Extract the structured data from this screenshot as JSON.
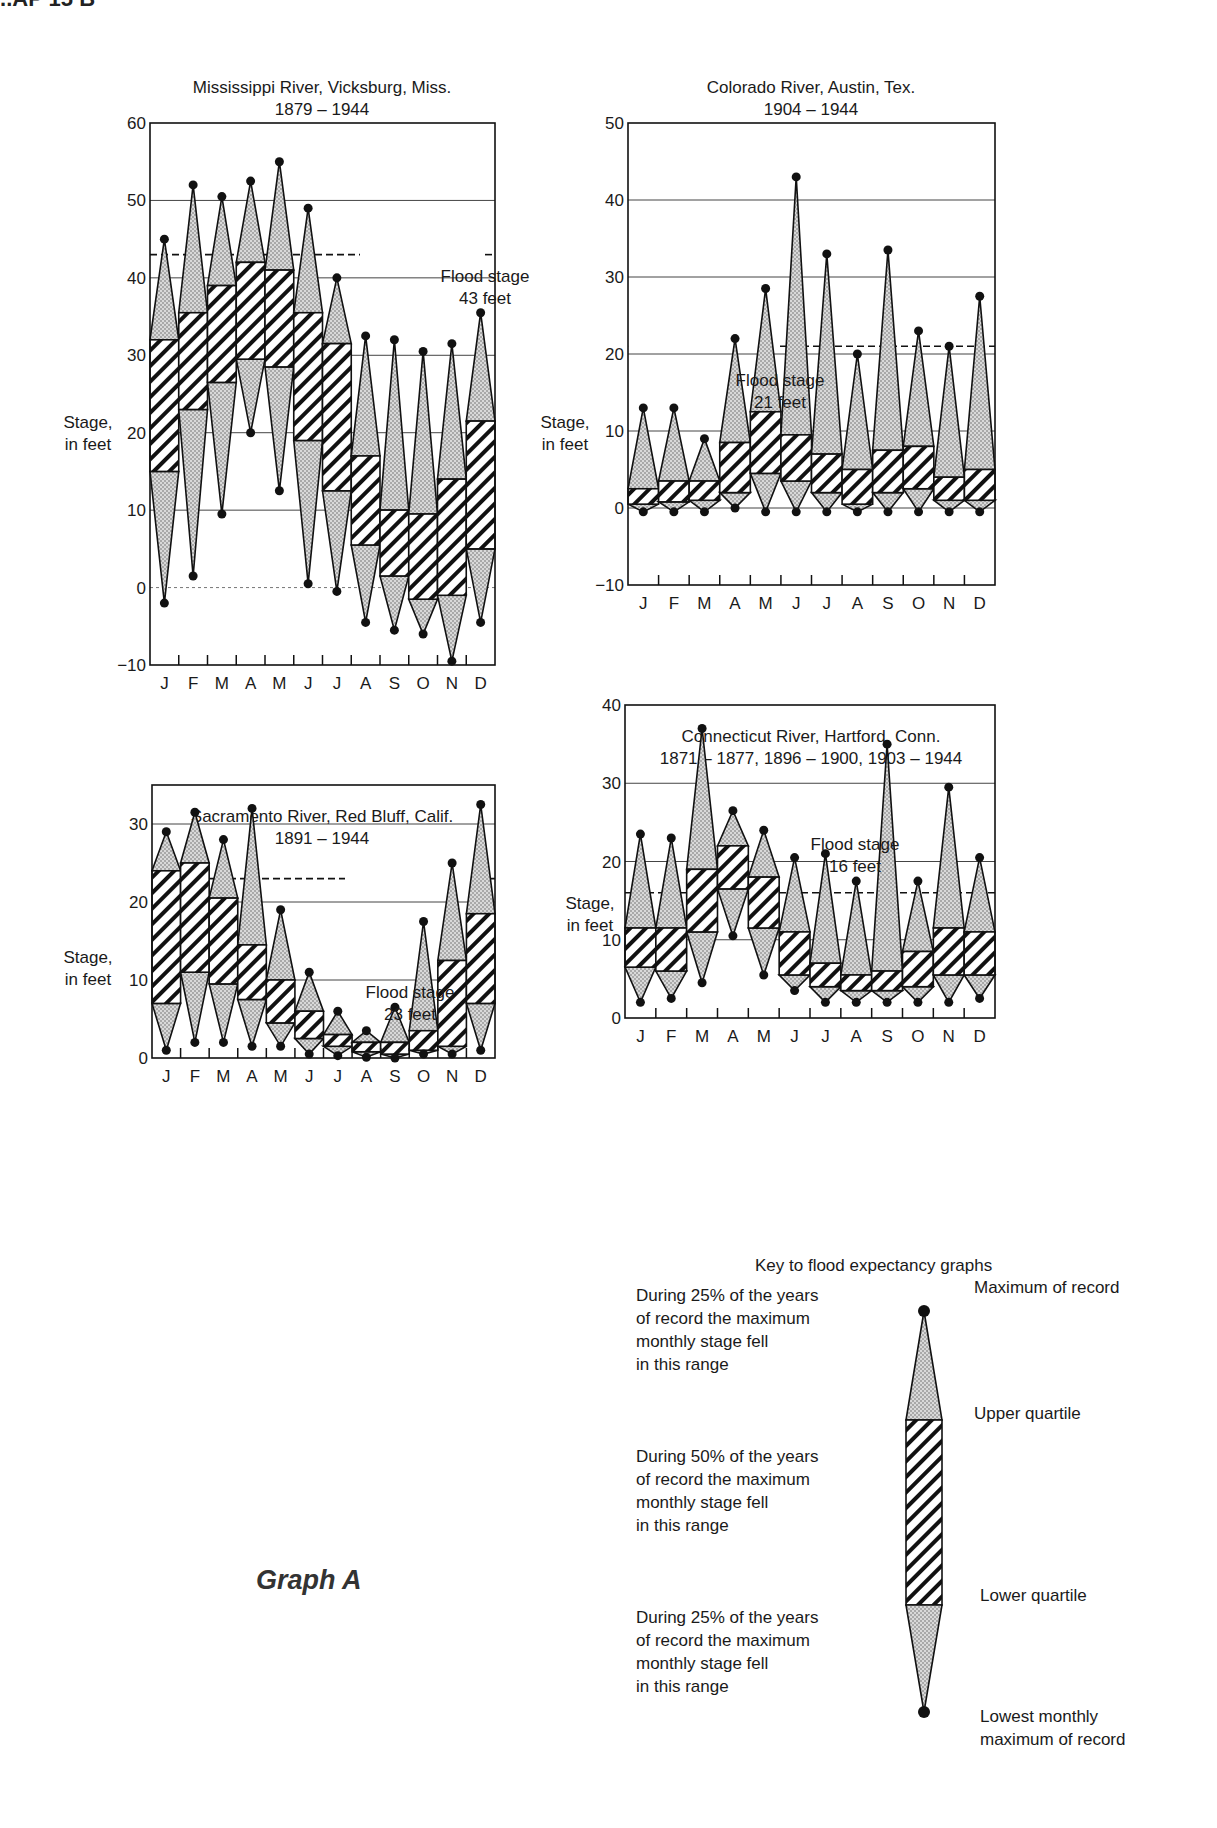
{
  "page": {
    "header_fragment": "...AP 15 B",
    "graph_label": "Graph A"
  },
  "key": {
    "title": "Key to flood expectancy graphs",
    "left_texts": [
      "During 25% of the years\nof record the maximum\nmonthly stage fell\nin this range",
      "During 50% of the years\nof record the maximum\nmonthly stage fell\nin this range",
      "During 25% of the years\nof record the maximum\nmonthly stage fell\nin this range"
    ],
    "right_labels": [
      "Maximum of record",
      "Upper quartile",
      "Lower quartile",
      "Lowest monthly\nmaximum of record"
    ]
  },
  "colors": {
    "ink": "#1a1a1a",
    "stipple": "#c9c9c9",
    "gridline": "#555555",
    "background": "#ffffff"
  },
  "chart_data": [
    {
      "type": "box-range",
      "title": "Mississippi River, Vicksburg, Miss.",
      "subtitle": "1879 – 1944",
      "xlabel": "",
      "ylabel": "Stage, in feet",
      "categories": [
        "J",
        "F",
        "M",
        "A",
        "M",
        "J",
        "J",
        "A",
        "S",
        "O",
        "N",
        "D"
      ],
      "ylim": [
        -10,
        60
      ],
      "yticks": [
        -10,
        0,
        10,
        20,
        30,
        40,
        50,
        60
      ],
      "grid": true,
      "flood_stage": {
        "value": 43,
        "label_line1": "Flood stage",
        "label_line2": "43 feet"
      },
      "series": [
        {
          "name": "Maximum of record",
          "values": [
            45,
            52,
            50.5,
            52.5,
            55,
            49,
            40,
            32.5,
            32,
            30.5,
            31.5,
            35.5
          ]
        },
        {
          "name": "Upper quartile",
          "values": [
            32,
            35.5,
            39,
            42,
            41,
            35.5,
            31.5,
            17,
            10,
            9.5,
            14,
            21.5
          ]
        },
        {
          "name": "Lower quartile",
          "values": [
            15,
            23,
            26.5,
            29.5,
            28.5,
            19,
            12.5,
            5.5,
            1.5,
            -1.5,
            -1,
            5
          ]
        },
        {
          "name": "Lowest monthly maximum of record",
          "values": [
            -2,
            1.5,
            9.5,
            20,
            12.5,
            0.5,
            -0.5,
            -4.5,
            -5.5,
            -6,
            -9.5,
            -4.5
          ]
        }
      ]
    },
    {
      "type": "box-range",
      "title": "Colorado River, Austin, Tex.",
      "subtitle": "1904 – 1944",
      "xlabel": "",
      "ylabel": "Stage, in feet",
      "categories": [
        "J",
        "F",
        "M",
        "A",
        "M",
        "J",
        "J",
        "A",
        "S",
        "O",
        "N",
        "D"
      ],
      "ylim": [
        -10,
        50
      ],
      "yticks": [
        -10,
        0,
        10,
        20,
        30,
        40,
        50
      ],
      "grid": true,
      "flood_stage": {
        "value": 21,
        "label_line1": "Flood stage",
        "label_line2": "21 feet"
      },
      "series": [
        {
          "name": "Maximum of record",
          "values": [
            13,
            13,
            9,
            22,
            28.5,
            43,
            33,
            20,
            33.5,
            23,
            21,
            27.5
          ]
        },
        {
          "name": "Upper quartile",
          "values": [
            2.5,
            3.5,
            3.5,
            8.5,
            12.5,
            9.5,
            7,
            5,
            7.5,
            8,
            4,
            5
          ]
        },
        {
          "name": "Lower quartile",
          "values": [
            0.5,
            0.8,
            1,
            2,
            4.5,
            3.5,
            2,
            0.5,
            2,
            2.5,
            1,
            1
          ]
        },
        {
          "name": "Lowest monthly maximum of record",
          "values": [
            -0.5,
            -0.5,
            -0.5,
            0,
            -0.5,
            -0.5,
            -0.5,
            -0.5,
            -0.5,
            -0.5,
            -0.5,
            -0.5
          ]
        }
      ]
    },
    {
      "type": "box-range",
      "title": "Sacramento River, Red Bluff, Calif.",
      "subtitle": "1891 – 1944",
      "xlabel": "",
      "ylabel": "Stage, in feet",
      "categories": [
        "J",
        "F",
        "M",
        "A",
        "M",
        "J",
        "J",
        "A",
        "S",
        "O",
        "N",
        "D"
      ],
      "ylim": [
        0,
        35
      ],
      "yticks": [
        0,
        10,
        20,
        30
      ],
      "grid": true,
      "flood_stage": {
        "value": 23,
        "label_line1": "Flood stage",
        "label_line2": "23 feet"
      },
      "series": [
        {
          "name": "Maximum of record",
          "values": [
            29,
            31.5,
            28,
            32,
            19,
            11,
            6,
            3.5,
            6.5,
            17.5,
            25,
            32.5
          ]
        },
        {
          "name": "Upper quartile",
          "values": [
            24,
            25,
            20.5,
            14.5,
            10,
            6,
            3,
            2,
            2,
            3.5,
            12.5,
            18.5
          ]
        },
        {
          "name": "Lower quartile",
          "values": [
            7,
            11,
            9.5,
            7.5,
            4.5,
            2.5,
            1.5,
            0.8,
            0.5,
            1,
            1.5,
            7
          ]
        },
        {
          "name": "Lowest monthly maximum of record",
          "values": [
            1,
            2,
            2,
            1.5,
            1.5,
            0.5,
            0.3,
            0.1,
            0,
            0.5,
            0.5,
            1
          ]
        }
      ]
    },
    {
      "type": "box-range",
      "title": "Connecticut River, Hartford, Conn.",
      "subtitle": "1871 – 1877, 1896 – 1900, 1903 – 1944",
      "xlabel": "",
      "ylabel": "Stage, in feet",
      "categories": [
        "J",
        "F",
        "M",
        "A",
        "M",
        "J",
        "J",
        "A",
        "S",
        "O",
        "N",
        "D"
      ],
      "ylim": [
        0,
        40
      ],
      "yticks": [
        0,
        10,
        20,
        30,
        40
      ],
      "grid": true,
      "flood_stage": {
        "value": 16,
        "label_line1": "Flood stage",
        "label_line2": "16 feet"
      },
      "series": [
        {
          "name": "Maximum of record",
          "values": [
            23.5,
            23,
            37,
            26.5,
            24,
            20.5,
            21,
            17.5,
            35,
            17.5,
            29.5,
            20.5
          ]
        },
        {
          "name": "Upper quartile",
          "values": [
            11.5,
            11.5,
            19,
            22,
            18,
            11,
            7,
            5.5,
            6,
            8.5,
            11.5,
            11
          ]
        },
        {
          "name": "Lower quartile",
          "values": [
            6.5,
            6,
            11,
            16.5,
            11.5,
            5.5,
            4,
            3.5,
            3.5,
            4,
            5.5,
            5.5
          ]
        },
        {
          "name": "Lowest monthly maximum of record",
          "values": [
            2,
            2.5,
            4.5,
            10.5,
            5.5,
            3.5,
            2,
            2,
            2,
            2,
            2,
            2.5
          ]
        }
      ]
    }
  ]
}
